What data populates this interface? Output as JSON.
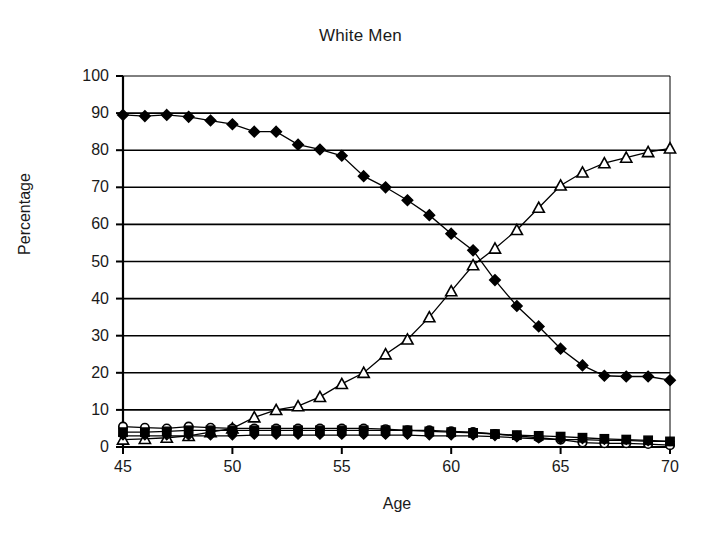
{
  "chart_data": {
    "type": "line",
    "title": "White Men",
    "xlabel": "Age",
    "ylabel": "Percentage",
    "xlim": [
      45,
      70
    ],
    "ylim": [
      0,
      100
    ],
    "xticks": [
      45,
      50,
      55,
      60,
      65,
      70
    ],
    "yticks": [
      0,
      10,
      20,
      30,
      40,
      50,
      60,
      70,
      80,
      90,
      100
    ],
    "grid": "horizontal",
    "legend": "none",
    "x": [
      45,
      46,
      47,
      48,
      49,
      50,
      51,
      52,
      53,
      54,
      55,
      56,
      57,
      58,
      59,
      60,
      61,
      62,
      63,
      64,
      65,
      66,
      67,
      68,
      69,
      70
    ],
    "series": [
      {
        "name": "Working full time",
        "marker": "filled-diamond",
        "values": [
          89.5,
          89.2,
          89.5,
          89.0,
          88.0,
          87.0,
          85.0,
          85.0,
          81.5,
          80.2,
          78.5,
          73.0,
          70.0,
          66.5,
          62.5,
          57.5,
          53.0,
          45.0,
          38.0,
          32.5,
          26.5,
          22.0,
          19.2,
          19.0,
          19.0,
          18.0
        ]
      },
      {
        "name": "Not working",
        "marker": "open-triangle",
        "values": [
          2.0,
          2.2,
          2.5,
          3.0,
          4.0,
          5.0,
          8.0,
          10.0,
          11.0,
          13.5,
          17.0,
          20.0,
          25.0,
          29.0,
          35.0,
          42.0,
          49.0,
          53.5,
          58.5,
          64.5,
          70.5,
          74.0,
          76.5,
          78.0,
          79.5,
          80.5
        ]
      },
      {
        "name": "Working part time",
        "marker": "open-circle",
        "values": [
          5.5,
          5.2,
          5.0,
          5.5,
          5.2,
          5.0,
          5.0,
          5.0,
          5.0,
          5.0,
          5.0,
          5.0,
          4.8,
          4.5,
          4.5,
          4.2,
          4.0,
          3.5,
          3.0,
          2.5,
          2.0,
          1.2,
          1.0,
          1.0,
          0.8,
          0.5
        ]
      },
      {
        "name": "Self employed",
        "marker": "filled-square",
        "values": [
          4.0,
          4.0,
          4.2,
          4.5,
          4.5,
          4.5,
          4.5,
          4.5,
          4.5,
          4.5,
          4.5,
          4.5,
          4.5,
          4.5,
          4.2,
          4.0,
          3.8,
          3.5,
          3.2,
          3.0,
          2.8,
          2.5,
          2.2,
          2.0,
          1.8,
          1.5
        ]
      },
      {
        "name": "Other",
        "marker": "small-filled-diamond",
        "values": [
          3.0,
          3.0,
          3.0,
          3.0,
          3.0,
          3.0,
          3.2,
          3.2,
          3.2,
          3.2,
          3.2,
          3.2,
          3.2,
          3.2,
          3.0,
          3.0,
          3.0,
          2.8,
          2.5,
          2.2,
          2.0,
          2.0,
          1.8,
          1.8,
          1.5,
          1.5
        ]
      }
    ]
  },
  "axis": {
    "y_tick_labels": [
      "100",
      "90",
      "80",
      "70",
      "60",
      "50",
      "40",
      "30",
      "20",
      "10",
      "0"
    ],
    "x_tick_labels": [
      "45",
      "50",
      "55",
      "60",
      "65",
      "70"
    ]
  },
  "colors": {
    "ink": "#000000",
    "grid": "#000000",
    "background": "#ffffff"
  }
}
